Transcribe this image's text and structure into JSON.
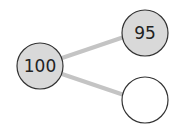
{
  "diagram": {
    "type": "number-bond",
    "whole": {
      "value": "100",
      "fill": "#d9d9d9"
    },
    "parts": [
      {
        "value": "95",
        "fill": "#d9d9d9"
      },
      {
        "value": "",
        "fill": "#ffffff"
      }
    ],
    "colors": {
      "stroke": "#333333",
      "connector": "#c4c4c4"
    }
  }
}
